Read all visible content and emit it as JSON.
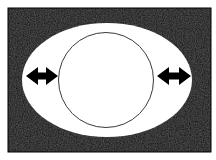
{
  "figure": {
    "title": "",
    "caption": "",
    "width": 216,
    "height": 160,
    "background_color": "#ffffff"
  },
  "colors": {
    "page_background": "#ffffff",
    "panel_fill": "#111111",
    "panel_edge": "#000000",
    "ellipse_fill": "#ffffff",
    "circle_stroke": "#3a3a3a",
    "circle_fill": "#ffffff",
    "arrow_fill": "#000000"
  },
  "panel": {
    "name": "black-field",
    "x": 8,
    "y": 8,
    "width": 203,
    "height": 144,
    "fill": "#111111"
  },
  "ellipse": {
    "name": "white-ellipse",
    "cx": 107,
    "cy": 80,
    "rx": 85,
    "ry": 57,
    "fill": "#ffffff",
    "label": ""
  },
  "circle": {
    "name": "inscribed-circle",
    "cx": 106,
    "cy": 80,
    "r": 47.5,
    "stroke": "#3a3a3a",
    "stroke_width": 1,
    "fill": "#ffffff",
    "label": ""
  },
  "arrows": [
    {
      "name": "left-double-arrow",
      "orientation": "horizontal",
      "heads": "both",
      "x_start": 26,
      "x_end": 58,
      "cy": 76,
      "shaft_height": 7,
      "head_height": 18,
      "head_width": 12,
      "fill": "#000000",
      "label": ""
    },
    {
      "name": "right-double-arrow",
      "orientation": "horizontal",
      "heads": "both",
      "x_start": 157,
      "x_end": 191,
      "cy": 76,
      "shaft_height": 7,
      "head_height": 18,
      "head_width": 12,
      "fill": "#000000",
      "label": ""
    }
  ],
  "annotations": [],
  "legend": {
    "visible": false,
    "items": []
  }
}
